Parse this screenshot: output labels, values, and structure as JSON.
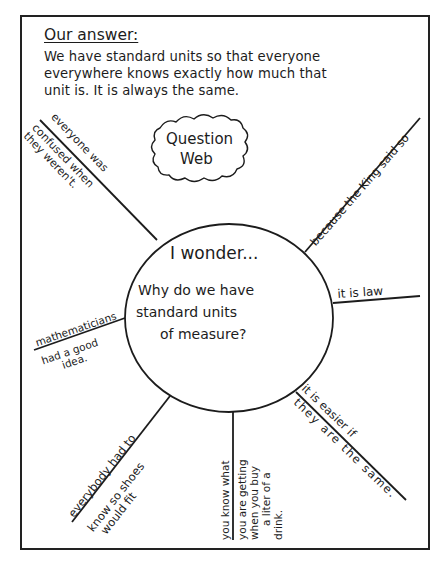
{
  "answer": {
    "title": "Our answer:",
    "lines": [
      "We have standard units so that everyone",
      "everywhere knows exactly how much that",
      "unit is. It is always the same."
    ]
  },
  "cloud": {
    "line1": "Question",
    "line2": "Web"
  },
  "center": {
    "heading": "I wonder...",
    "line1": "Why do we have",
    "line2": "standard units",
    "line3": "of measure?"
  },
  "branches": [
    {
      "id": "confused",
      "line1": "everyone was",
      "line2": "confused when",
      "line3": "they weren't."
    },
    {
      "id": "king",
      "line1": "because the King said so"
    },
    {
      "id": "law",
      "line1": "it is law"
    },
    {
      "id": "mathematicians",
      "line1": "mathematicians",
      "line2": "had a good",
      "line3": "idea."
    },
    {
      "id": "shoes",
      "line1": "everybody had to",
      "line2": "know so shoes",
      "line3": "would fit"
    },
    {
      "id": "drink",
      "line1": "you know what",
      "line2": "you are getting",
      "line3": "when you buy",
      "line4": "a liter of a",
      "line5": "drink."
    },
    {
      "id": "easier",
      "line1": "it is easier if",
      "line2": "they are the same."
    }
  ],
  "colors": {
    "ink": "#1c1c1c",
    "paper": "#ffffff"
  }
}
